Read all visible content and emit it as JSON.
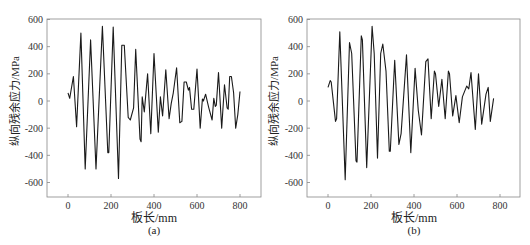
{
  "chart_data": [
    {
      "type": "line",
      "caption": "(a)",
      "title": "",
      "xlabel": "板长/mm",
      "ylabel": "纵向残余应力/MPa",
      "xlim": [
        -90,
        900
      ],
      "ylim": [
        -700,
        600
      ],
      "xticks": [
        0,
        200,
        400,
        600,
        800
      ],
      "yticks": [
        -600,
        -400,
        -200,
        0,
        200,
        400,
        600
      ],
      "grid": false,
      "legend": null,
      "series": [
        {
          "name": "a",
          "x": [
            0,
            8,
            25,
            40,
            60,
            80,
            105,
            130,
            160,
            185,
            190,
            210,
            235,
            250,
            262,
            280,
            290,
            305,
            315,
            335,
            340,
            345,
            355,
            370,
            385,
            400,
            420,
            430,
            440,
            455,
            470,
            480,
            490,
            505,
            520,
            530,
            540,
            550,
            560,
            565,
            575,
            585,
            600,
            615,
            625,
            630,
            640,
            655,
            670,
            678,
            685,
            690,
            700,
            715,
            728,
            740,
            745,
            752,
            760,
            770,
            780,
            790,
            800
          ],
          "y": [
            60,
            20,
            180,
            -190,
            500,
            -500,
            450,
            -500,
            550,
            -380,
            -380,
            545,
            -570,
            410,
            410,
            -120,
            -140,
            -50,
            380,
            -280,
            -300,
            30,
            -80,
            200,
            -240,
            350,
            -230,
            30,
            -110,
            230,
            -130,
            -20,
            60,
            245,
            -160,
            -150,
            140,
            140,
            80,
            100,
            -60,
            -60,
            235,
            -200,
            15,
            0,
            50,
            -50,
            -140,
            20,
            -40,
            -30,
            210,
            -200,
            120,
            -50,
            -60,
            180,
            180,
            60,
            -200,
            -100,
            70
          ]
        }
      ]
    },
    {
      "type": "line",
      "caption": "(b)",
      "title": "",
      "xlabel": "板长/mm",
      "ylabel": "纵向残余应力/MPa",
      "xlim": [
        -90,
        900
      ],
      "ylim": [
        -700,
        600
      ],
      "xticks": [
        0,
        200,
        400,
        600,
        800
      ],
      "yticks": [
        -600,
        -400,
        -200,
        0,
        200,
        400,
        600
      ],
      "grid": false,
      "legend": null,
      "series": [
        {
          "name": "b",
          "x": [
            0,
            10,
            15,
            35,
            40,
            55,
            80,
            100,
            110,
            130,
            135,
            155,
            160,
            180,
            205,
            215,
            230,
            245,
            255,
            270,
            285,
            290,
            310,
            330,
            340,
            365,
            385,
            405,
            420,
            435,
            455,
            465,
            480,
            495,
            500,
            515,
            530,
            545,
            560,
            565,
            580,
            595,
            610,
            625,
            645,
            655,
            665,
            685,
            700,
            715,
            735,
            745,
            755,
            770
          ],
          "y": [
            100,
            150,
            140,
            -150,
            -130,
            510,
            -580,
            430,
            350,
            -440,
            -450,
            480,
            450,
            -490,
            550,
            350,
            -420,
            350,
            420,
            220,
            -370,
            -370,
            300,
            -320,
            -240,
            340,
            -380,
            240,
            -70,
            -250,
            290,
            310,
            -130,
            220,
            200,
            -40,
            160,
            -130,
            220,
            200,
            -110,
            40,
            -160,
            30,
            110,
            90,
            210,
            -210,
            200,
            -170,
            50,
            100,
            -150,
            20
          ]
        }
      ]
    }
  ],
  "panels": [
    {
      "caption": "(a)",
      "xlabel": "板长/mm",
      "ylabel": "纵向残余应力/MPa"
    },
    {
      "caption": "(b)",
      "xlabel": "板长/mm",
      "ylabel": "纵向残余应力/MPa"
    }
  ],
  "style": {
    "line_color": "#1a1a1a",
    "axis_color": "#888888"
  }
}
